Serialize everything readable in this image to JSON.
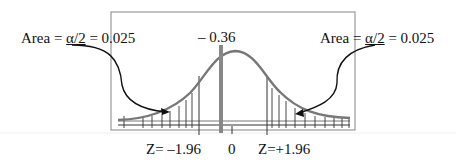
{
  "diagram": {
    "type": "normal-distribution-two-tailed-test",
    "left_tail_label": {
      "prefix": "Area = ",
      "alpha_fraction": "α/2",
      "suffix": " = 0.025"
    },
    "right_tail_label": {
      "prefix": "Area = ",
      "alpha_fraction": "α/2",
      "suffix": " = 0.025"
    },
    "test_statistic_label": "– 0.36",
    "axis_labels": {
      "left_critical": "Z= –1.96",
      "center": "0",
      "right_critical": "Z=+1.96"
    },
    "values": {
      "alpha_over_2": 0.025,
      "test_statistic": -0.36,
      "critical_low": -1.96,
      "critical_high": 1.96,
      "mean": 0
    },
    "colors": {
      "curve": "#777777",
      "test_stat_bar": "#888888",
      "frame": "#999999",
      "ink": "#111111"
    }
  }
}
